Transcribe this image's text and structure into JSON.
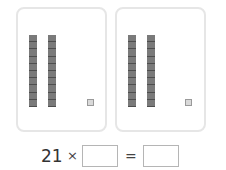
{
  "cards": [
    {
      "tens_rods": 2,
      "ones_cubes": 1
    },
    {
      "tens_rods": 2,
      "ones_cubes": 1
    }
  ],
  "equation": {
    "multiplicand": "21",
    "operator": "×",
    "equals": "=",
    "answer_box_1": "",
    "answer_box_2": ""
  },
  "colors": {
    "rod": "#7a7a7a",
    "cube": "#d9d9d9",
    "card_border": "#e6e6e6"
  }
}
